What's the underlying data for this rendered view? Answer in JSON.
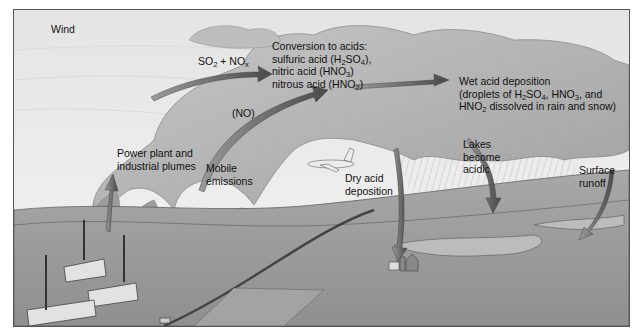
{
  "diagram": {
    "labels": {
      "wind": "Wind",
      "so2_nox": {
        "a": "SO",
        "a_sub": "2",
        "b": " + NO",
        "b_sub": "x"
      },
      "conversion": {
        "line1": "Conversion to acids:",
        "line2": {
          "pre": "sulfuric acid (H",
          "s1": "2",
          "mid": "SO",
          "s2": "4",
          "post": "),"
        },
        "line3": {
          "pre": "nitric acid (HNO",
          "s1": "3",
          "post": ")"
        },
        "line4": {
          "pre": "nitrous acid (HNO",
          "s1": "2",
          "post": ")"
        }
      },
      "wet": {
        "line1": "Wet acid deposition",
        "line2": {
          "pre": "(droplets of H",
          "s1": "2",
          "mid": "SO",
          "s2": "4",
          "mid2": ", HNO",
          "s3": "3",
          "post": ", and"
        },
        "line3": {
          "pre": "HNO",
          "s1": "2",
          "post": " dissolved in rain and snow)"
        }
      },
      "no": "(NO)",
      "power_plant": {
        "line1": "Power plant and",
        "line2": "industrial plumes"
      },
      "mobile": {
        "line1": "Mobile",
        "line2": "emissions"
      },
      "dry": {
        "line1": "Dry acid",
        "line2": "deposition"
      },
      "lakes": {
        "line1": "Lakes",
        "line2": "become",
        "line3": "acidic"
      },
      "runoff": {
        "line1": "Surface",
        "line2": "runoff"
      }
    },
    "colors": {
      "sky": "#ececec",
      "cloud": "#a9a9a9",
      "cloud_dark": "#8e8e8e",
      "ground": "#9a9a9a",
      "ground_far": "#b5b5b5",
      "arrow": "#5a5a5a",
      "building": "#e2e2e2"
    }
  }
}
